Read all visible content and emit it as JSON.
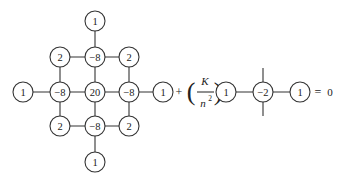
{
  "stencil_9pt_biharmonic": {
    "nodes": [
      {
        "id": "top",
        "label": "1",
        "x": 95,
        "y": 21
      },
      {
        "id": "ul",
        "label": "2",
        "x": 60,
        "y": 57
      },
      {
        "id": "um",
        "label": "−8",
        "x": 95,
        "y": 57
      },
      {
        "id": "ur",
        "label": "2",
        "x": 129,
        "y": 57
      },
      {
        "id": "far-left",
        "label": "1",
        "x": 23,
        "y": 92
      },
      {
        "id": "ml",
        "label": "−8",
        "x": 60,
        "y": 92
      },
      {
        "id": "center",
        "label": "20",
        "x": 95,
        "y": 92
      },
      {
        "id": "mr",
        "label": "−8",
        "x": 129,
        "y": 92
      },
      {
        "id": "far-right",
        "label": "1",
        "x": 163,
        "y": 92
      },
      {
        "id": "ll",
        "label": "2",
        "x": 60,
        "y": 126
      },
      {
        "id": "lm",
        "label": "−8",
        "x": 95,
        "y": 126
      },
      {
        "id": "lr",
        "label": "2",
        "x": 129,
        "y": 126
      },
      {
        "id": "bottom",
        "label": "1",
        "x": 95,
        "y": 162
      }
    ]
  },
  "operator": {
    "plus": "+",
    "coef_numerator": "K",
    "coef_denominator": "n",
    "coef_exponent": "2",
    "left_paren": "(",
    "right_paren": ")"
  },
  "stencil_laplacian_1d": {
    "nodes": [
      {
        "id": "l1",
        "label": "1",
        "x": 226,
        "y": 92
      },
      {
        "id": "c",
        "label": "−2",
        "x": 263,
        "y": 92
      },
      {
        "id": "r1",
        "label": "1",
        "x": 300,
        "y": 92
      }
    ]
  },
  "equation": {
    "equals": "=",
    "rhs": "0"
  }
}
